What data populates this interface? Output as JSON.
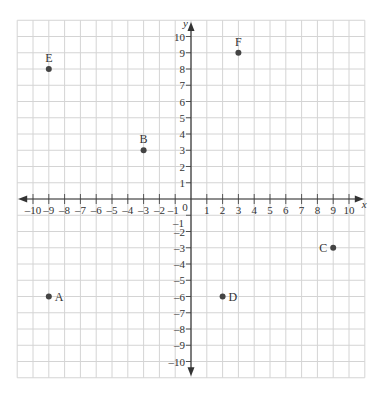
{
  "chart_data": {
    "type": "scatter",
    "title": "",
    "xlabel": "x",
    "ylabel": "y",
    "xlim": [
      -10,
      10
    ],
    "ylim": [
      -10,
      10
    ],
    "grid": true,
    "x_ticks": [
      -10,
      -9,
      -8,
      -7,
      -6,
      -5,
      -4,
      -3,
      -2,
      -1,
      1,
      2,
      3,
      4,
      5,
      6,
      7,
      8,
      9,
      10
    ],
    "y_ticks": [
      -10,
      -9,
      -8,
      -7,
      -6,
      -5,
      -4,
      -3,
      -2,
      -1,
      1,
      2,
      3,
      4,
      5,
      6,
      7,
      8,
      9,
      10
    ],
    "origin_label": "0",
    "points": [
      {
        "label": "A",
        "x": -9,
        "y": -6,
        "label_pos": "right"
      },
      {
        "label": "B",
        "x": -3,
        "y": 3,
        "label_pos": "above"
      },
      {
        "label": "C",
        "x": 9,
        "y": -3,
        "label_pos": "left"
      },
      {
        "label": "D",
        "x": 2,
        "y": -6,
        "label_pos": "right"
      },
      {
        "label": "E",
        "x": -9,
        "y": 8,
        "label_pos": "above"
      },
      {
        "label": "F",
        "x": 3,
        "y": 9,
        "label_pos": "above"
      }
    ]
  },
  "style": {
    "grid_color": "#d4d4d4",
    "axis_color": "#333333",
    "point_color": "#444444"
  }
}
